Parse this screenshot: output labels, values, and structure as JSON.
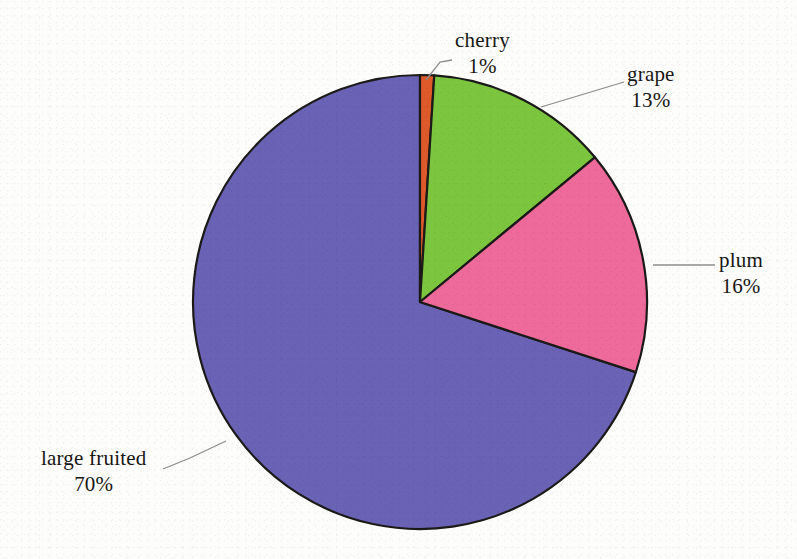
{
  "chart_data": {
    "type": "pie",
    "title": "",
    "subtitle": "",
    "xlabel": "",
    "ylabel": "",
    "legend_position": "none",
    "grid": false,
    "labels_show_percent": true,
    "start_angle_deg": 0,
    "direction": "clockwise",
    "categories": [
      "cherry",
      "grape",
      "plum",
      "large fruited"
    ],
    "values": [
      1,
      13,
      16,
      70
    ],
    "value_labels": [
      "1%",
      "13%",
      "16%",
      "70%"
    ],
    "colors": [
      "#DE5A2B",
      "#7CC63F",
      "#ED6A9A",
      "#6A62B4"
    ],
    "slices": [
      {
        "name": "cherry",
        "value": 1,
        "label": "cherry",
        "percent_label": "1%",
        "color": "#DE5A2B"
      },
      {
        "name": "grape",
        "value": 13,
        "label": "grape",
        "percent_label": "13%",
        "color": "#7CC63F"
      },
      {
        "name": "plum",
        "value": 16,
        "label": "plum",
        "percent_label": "16%",
        "color": "#ED6A9A"
      },
      {
        "name": "large fruited",
        "value": 70,
        "label": "large fruited",
        "percent_label": "70%",
        "color": "#6A62B4"
      }
    ]
  },
  "labels": {
    "cherry": {
      "name": "cherry",
      "percent": "1%"
    },
    "grape": {
      "name": "grape",
      "percent": "13%"
    },
    "plum": {
      "name": "plum",
      "percent": "16%"
    },
    "large_fruited": {
      "name": "large fruited",
      "percent": "70%"
    }
  },
  "style": {
    "background": "#fdfdfc",
    "outline": "#1b1a18",
    "leader_line": "#8d8d8d",
    "text": "#181614"
  }
}
